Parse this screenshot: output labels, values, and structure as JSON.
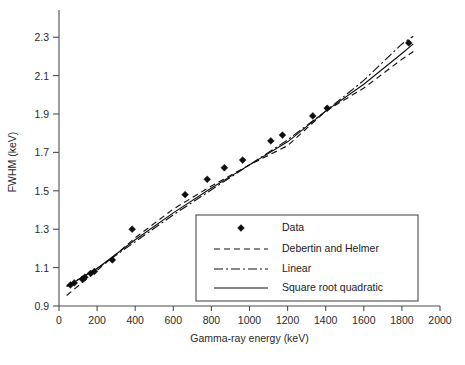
{
  "chart_data": {
    "type": "scatter",
    "title": "",
    "xlabel": "Gamma-ray energy (keV)",
    "ylabel": "FWHM (keV)",
    "xlim": [
      0,
      2000
    ],
    "ylim": [
      0.9,
      2.4
    ],
    "xticks": [
      0,
      200,
      400,
      600,
      800,
      1000,
      1200,
      1400,
      1600,
      1800,
      2000
    ],
    "xtick_labels": [
      "0",
      "200",
      "400",
      "600",
      "800",
      "1000",
      "1200",
      "1400",
      "1600",
      "1800",
      "2000"
    ],
    "yticks": [
      0.9,
      1.1,
      1.3,
      1.5,
      1.7,
      1.9,
      2.1,
      2.3
    ],
    "ytick_labels": [
      "0.9",
      "1.1",
      "1.3",
      "1.5",
      "1.7",
      "1.9",
      "2.1",
      "2.3"
    ],
    "grid": false,
    "legend_position": "lower-right",
    "series": [
      {
        "name": "Data",
        "type": "scatter",
        "marker": "diamond",
        "color": "#0d0d0d",
        "points": [
          {
            "x": 60,
            "y": 1.01
          },
          {
            "x": 80,
            "y": 1.02
          },
          {
            "x": 122,
            "y": 1.04
          },
          {
            "x": 136,
            "y": 1.05
          },
          {
            "x": 166,
            "y": 1.07
          },
          {
            "x": 186,
            "y": 1.08
          },
          {
            "x": 280,
            "y": 1.14
          },
          {
            "x": 384,
            "y": 1.3
          },
          {
            "x": 662,
            "y": 1.48
          },
          {
            "x": 778,
            "y": 1.56
          },
          {
            "x": 868,
            "y": 1.62
          },
          {
            "x": 964,
            "y": 1.66
          },
          {
            "x": 1112,
            "y": 1.76
          },
          {
            "x": 1173,
            "y": 1.79
          },
          {
            "x": 1332,
            "y": 1.89
          },
          {
            "x": 1408,
            "y": 1.93
          },
          {
            "x": 1836,
            "y": 2.27
          }
        ]
      },
      {
        "name": "Debertin and Helmer",
        "type": "line",
        "style": "dashed",
        "color": "#111111",
        "x": [
          40,
          200,
          400,
          600,
          800,
          1000,
          1200,
          1400,
          1600,
          1800,
          1860
        ],
        "y": [
          0.955,
          1.085,
          1.255,
          1.405,
          1.525,
          1.635,
          1.735,
          1.915,
          2.035,
          2.185,
          2.225
        ]
      },
      {
        "name": "Linear",
        "type": "line",
        "style": "dashdot",
        "color": "#111111",
        "x": [
          40,
          200,
          400,
          600,
          800,
          1000,
          1200,
          1400,
          1600,
          1800,
          1860
        ],
        "y": [
          1.005,
          1.095,
          1.235,
          1.375,
          1.505,
          1.635,
          1.765,
          1.915,
          2.075,
          2.265,
          2.305
        ]
      },
      {
        "name": "Square root quadratic",
        "type": "line",
        "style": "solid",
        "color": "#111111",
        "x": [
          40,
          200,
          400,
          600,
          800,
          1000,
          1200,
          1400,
          1600,
          1800,
          1860
        ],
        "y": [
          1.0,
          1.095,
          1.245,
          1.385,
          1.515,
          1.635,
          1.755,
          1.915,
          2.055,
          2.215,
          2.265
        ]
      }
    ]
  },
  "legend": {
    "entries": [
      {
        "label": "Data",
        "style": "marker"
      },
      {
        "label": "Debertin and Helmer",
        "style": "dashed"
      },
      {
        "label": "Linear",
        "style": "dashdot"
      },
      {
        "label": "Square root quadratic",
        "style": "solid"
      }
    ]
  }
}
